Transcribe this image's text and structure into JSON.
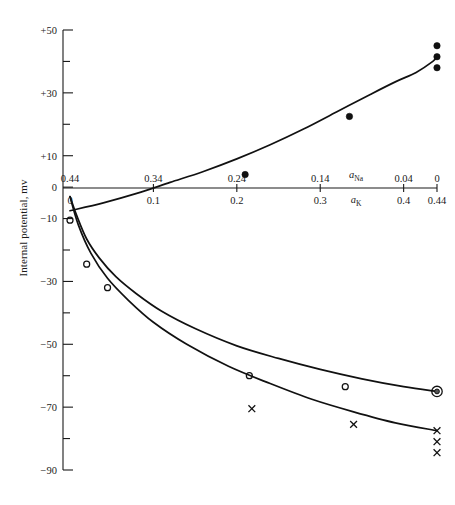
{
  "figure": {
    "ylabel": "Internal potential, mv",
    "y_axis": {
      "ticks": [
        {
          "value": 50,
          "label": "+50"
        },
        {
          "value": 30,
          "label": "+30"
        },
        {
          "value": 10,
          "label": "+10"
        },
        {
          "value": 0,
          "label": "0"
        },
        {
          "value": -10,
          "label": "−10"
        },
        {
          "value": -30,
          "label": "−30"
        },
        {
          "value": -50,
          "label": "−50"
        },
        {
          "value": -70,
          "label": "−70"
        },
        {
          "value": -90,
          "label": "−90"
        }
      ],
      "minor_ticks": [
        40,
        20,
        -20,
        -40,
        -60,
        -80
      ],
      "range": [
        -90,
        50
      ]
    },
    "x_axis_top": {
      "name": "a",
      "name_sub": "Na",
      "ticks": [
        {
          "pos": 0.0,
          "label": "0.44"
        },
        {
          "pos": 0.1,
          "label": "0.34"
        },
        {
          "pos": 0.2,
          "label": "0.24"
        },
        {
          "pos": 0.3,
          "label": "0.14"
        },
        {
          "pos": 0.4,
          "label": "0.04"
        },
        {
          "pos": 0.44,
          "label": "0"
        }
      ]
    },
    "x_axis_bottom": {
      "name": "a",
      "name_sub": "K",
      "ticks": [
        {
          "pos": 0.0,
          "label": "0"
        },
        {
          "pos": 0.1,
          "label": "0.1"
        },
        {
          "pos": 0.2,
          "label": "0.2"
        },
        {
          "pos": 0.3,
          "label": "0.3"
        },
        {
          "pos": 0.4,
          "label": "0.4"
        },
        {
          "pos": 0.44,
          "label": "0.44"
        }
      ]
    }
  },
  "chart_data": {
    "type": "line",
    "title": "",
    "xlabel": "a_Na (top) / a_K (bottom)",
    "ylabel": "Internal potential, mv",
    "xlim": [
      0,
      0.44
    ],
    "ylim": [
      -90,
      50
    ],
    "grid": false,
    "legend": "none",
    "x_top_ticks": [
      "0.44",
      "0.34",
      "0.24",
      "0.14",
      "0.04",
      "0"
    ],
    "x_bottom_ticks": [
      "0",
      "0.1",
      "0.2",
      "0.3",
      "0.4",
      "0.44"
    ],
    "y_ticks": [
      "+50",
      "+30",
      "+10",
      "0",
      "−10",
      "−30",
      "−50",
      "−70",
      "−90"
    ],
    "series": [
      {
        "name": "upper-curve-filled-circles",
        "marker": "filled-circle",
        "curve_points": [
          [
            0.0,
            -7.5
          ],
          [
            0.04,
            -5.0
          ],
          [
            0.08,
            -2.0
          ],
          [
            0.12,
            1.5
          ],
          [
            0.16,
            5.0
          ],
          [
            0.2,
            9.0
          ],
          [
            0.24,
            13.5
          ],
          [
            0.28,
            18.5
          ],
          [
            0.32,
            24.0
          ],
          [
            0.36,
            29.5
          ],
          [
            0.39,
            33.5
          ],
          [
            0.415,
            36.5
          ],
          [
            0.435,
            40.0
          ],
          [
            0.44,
            41.5
          ]
        ],
        "points": [
          [
            0.21,
            4.0
          ],
          [
            0.335,
            22.5
          ],
          [
            0.44,
            45.0
          ],
          [
            0.44,
            41.5
          ],
          [
            0.44,
            38.0
          ]
        ]
      },
      {
        "name": "middle-curve-open-circles",
        "marker": "open-circle",
        "curve_points": [
          [
            0.0,
            -3.0
          ],
          [
            0.008,
            -9.0
          ],
          [
            0.02,
            -16.5
          ],
          [
            0.035,
            -22.5
          ],
          [
            0.055,
            -28.5
          ],
          [
            0.08,
            -34.0
          ],
          [
            0.11,
            -39.5
          ],
          [
            0.15,
            -45.0
          ],
          [
            0.2,
            -50.5
          ],
          [
            0.25,
            -54.5
          ],
          [
            0.3,
            -58.0
          ],
          [
            0.35,
            -61.0
          ],
          [
            0.4,
            -63.5
          ],
          [
            0.44,
            -65.0
          ]
        ],
        "points": [
          [
            0.0,
            -10.5
          ],
          [
            0.02,
            -24.5
          ],
          [
            0.045,
            -32.0
          ],
          [
            0.215,
            -60.0
          ],
          [
            0.33,
            -63.5
          ],
          [
            0.44,
            -65.0
          ]
        ]
      },
      {
        "name": "lower-curve-x-markers",
        "marker": "cross",
        "curve_points": [
          [
            0.0,
            -3.0
          ],
          [
            0.01,
            -12.0
          ],
          [
            0.025,
            -21.0
          ],
          [
            0.045,
            -29.0
          ],
          [
            0.07,
            -36.0
          ],
          [
            0.1,
            -43.0
          ],
          [
            0.14,
            -50.0
          ],
          [
            0.19,
            -57.0
          ],
          [
            0.24,
            -62.5
          ],
          [
            0.29,
            -67.5
          ],
          [
            0.34,
            -71.5
          ],
          [
            0.39,
            -75.0
          ],
          [
            0.44,
            -77.5
          ]
        ],
        "points": [
          [
            0.218,
            -70.5
          ],
          [
            0.34,
            -75.5
          ],
          [
            0.44,
            -77.5
          ],
          [
            0.44,
            -81.0
          ],
          [
            0.44,
            -84.5
          ]
        ]
      }
    ]
  }
}
